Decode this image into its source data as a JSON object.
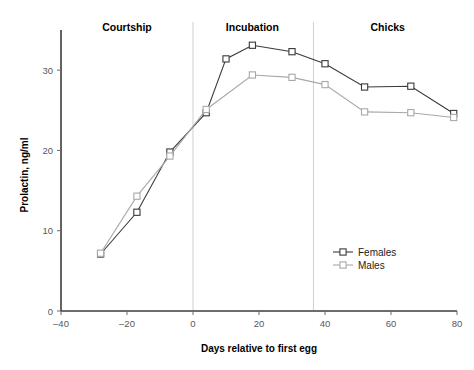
{
  "figure": {
    "cropped_caption_fragment": "",
    "background_color": "#ffffff"
  },
  "chart_data": {
    "type": "line",
    "title": "",
    "xlabel": "Days relative to first egg",
    "ylabel": "Prolactin, ng/ml",
    "xlim": [
      -40,
      80
    ],
    "ylim": [
      0,
      35
    ],
    "xticks": [
      -40,
      -20,
      0,
      20,
      40,
      60,
      80
    ],
    "xtick_labels": [
      "–40",
      "–20",
      "0",
      "20",
      "40",
      "60",
      "80"
    ],
    "yticks": [
      0,
      10,
      20,
      30
    ],
    "ytick_labels": [
      "0",
      "10",
      "20",
      "30"
    ],
    "grid": false,
    "legend_position": "center-right",
    "marker": "square-open",
    "series": [
      {
        "name": "Females",
        "color": "#3a3a3a",
        "x": [
          -28,
          -17,
          -7,
          4,
          10,
          18,
          30,
          40,
          52,
          66,
          79
        ],
        "values": [
          7.1,
          12.3,
          19.8,
          24.7,
          31.4,
          33.1,
          32.3,
          30.8,
          27.9,
          28.0,
          24.6
        ]
      },
      {
        "name": "Males",
        "color": "#a8a8a8",
        "x": [
          -28,
          -17,
          -7,
          4,
          18,
          30,
          40,
          52,
          66,
          79
        ],
        "values": [
          7.2,
          14.3,
          19.3,
          25.1,
          29.4,
          29.1,
          28.2,
          24.8,
          24.7,
          24.1
        ]
      }
    ],
    "phase_separators": [
      {
        "x": 0,
        "color": "#d0d0d4"
      },
      {
        "x": 36.5,
        "color": "#d0d0d4"
      }
    ],
    "phase_labels": [
      {
        "label": "Courtship",
        "x": -20
      },
      {
        "label": "Incubation",
        "x": 18
      },
      {
        "label": "Chicks",
        "x": 59
      }
    ],
    "legend": [
      {
        "label": "Females",
        "color": "#3a3a3a"
      },
      {
        "label": "Males",
        "color": "#a8a8a8"
      }
    ]
  }
}
